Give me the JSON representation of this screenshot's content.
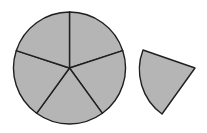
{
  "diagram": {
    "colors": {
      "fill": "#b5b5b5",
      "stroke": "#1f1f1f",
      "background": "#ffffff"
    },
    "circle": {
      "cx": 69.5,
      "cy": 68,
      "r": 56,
      "sectors": 5
    },
    "detached_sector": {
      "apex": [
        195,
        68
      ],
      "arc_start": [
        143,
        50
      ],
      "arc_end": [
        162,
        114
      ],
      "r": 55
    }
  }
}
